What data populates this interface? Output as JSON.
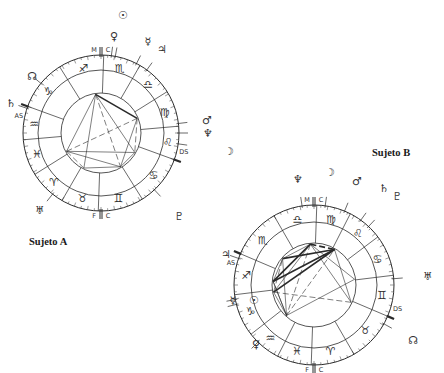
{
  "labels": {
    "subject_a": "Sujeto A",
    "subject_b": "Sujeto B"
  },
  "colors": {
    "ink": "#2a2a2a",
    "thin_line": "#555555",
    "background": "#ffffff"
  },
  "angle_labels": {
    "mc": [
      "M",
      "C"
    ],
    "ic": [
      "F",
      "C"
    ],
    "asc": "AS",
    "dsc": "DS"
  },
  "charts": [
    {
      "id": "sujeto-a",
      "center": [
        101,
        133
      ],
      "radii": {
        "outer": 78,
        "mid": 63,
        "inner": 40
      },
      "asc_angle_deg": 160,
      "house_cusps_deg": [
        160,
        185,
        212,
        240,
        268,
        302,
        340,
        5,
        32,
        60,
        88,
        122
      ],
      "signs": [
        {
          "glyph": "♒",
          "name": "aquarius"
        },
        {
          "glyph": "♓",
          "name": "pisces"
        },
        {
          "glyph": "♈",
          "name": "aries"
        },
        {
          "glyph": "♉",
          "name": "taurus"
        },
        {
          "glyph": "♊",
          "name": "gemini"
        },
        {
          "glyph": "♋",
          "name": "cancer"
        },
        {
          "glyph": "♌",
          "name": "leo"
        },
        {
          "glyph": "♍",
          "name": "virgo"
        },
        {
          "glyph": "♎",
          "name": "libra"
        },
        {
          "glyph": "♏",
          "name": "scorpio"
        },
        {
          "glyph": "♐",
          "name": "sagittarius"
        },
        {
          "glyph": "♑",
          "name": "capricorn"
        }
      ],
      "planets": [
        {
          "glyph": "☉",
          "name": "sun",
          "pos": [
            123,
            15
          ]
        },
        {
          "glyph": "♀",
          "name": "venus",
          "pos": [
            114,
            36
          ]
        },
        {
          "glyph": "☿",
          "name": "mercury",
          "pos": [
            148,
            41
          ]
        },
        {
          "glyph": "♃",
          "name": "jupiter",
          "pos": [
            162,
            49
          ]
        },
        {
          "glyph": "☊",
          "name": "north-node",
          "pos": [
            32,
            76
          ]
        },
        {
          "glyph": "♄",
          "name": "saturn",
          "pos": [
            11,
            103
          ]
        },
        {
          "glyph": "♂",
          "name": "mars",
          "pos": [
            207,
            120
          ]
        },
        {
          "glyph": "♆",
          "name": "neptune",
          "pos": [
            208,
            133
          ]
        },
        {
          "glyph": "☽",
          "name": "moon",
          "pos": [
            229,
            151
          ]
        },
        {
          "glyph": "♅",
          "name": "uranus",
          "pos": [
            40,
            210
          ]
        },
        {
          "glyph": "♇",
          "name": "pluto",
          "pos": [
            179,
            216
          ]
        }
      ],
      "aspect_points_deg": [
        98,
        208,
        22,
        300,
        330,
        244
      ],
      "aspects": [
        [
          0,
          1,
          1
        ],
        [
          0,
          2,
          2
        ],
        [
          0,
          3,
          1
        ],
        [
          0,
          4,
          1
        ],
        [
          1,
          3,
          1
        ],
        [
          1,
          2,
          1
        ],
        [
          2,
          3,
          1
        ],
        [
          2,
          4,
          1
        ],
        [
          3,
          4,
          1
        ],
        [
          0,
          5,
          1
        ],
        [
          5,
          3,
          1
        ],
        [
          5,
          1,
          1
        ],
        [
          4,
          1,
          1
        ]
      ]
    },
    {
      "id": "sujeto-b",
      "center": [
        314,
        285
      ],
      "radii": {
        "outer": 80,
        "mid": 63,
        "inner": 42
      },
      "asc_angle_deg": 157,
      "house_cusps_deg": [
        157,
        187,
        218,
        243,
        268,
        300,
        337,
        7,
        37,
        63,
        88,
        120
      ],
      "signs": [
        {
          "glyph": "♐",
          "name": "sagittarius"
        },
        {
          "glyph": "♑",
          "name": "capricorn"
        },
        {
          "glyph": "♒",
          "name": "aquarius"
        },
        {
          "glyph": "♓",
          "name": "pisces"
        },
        {
          "glyph": "♈",
          "name": "aries"
        },
        {
          "glyph": "♉",
          "name": "taurus"
        },
        {
          "glyph": "♊",
          "name": "gemini"
        },
        {
          "glyph": "♋",
          "name": "cancer"
        },
        {
          "glyph": "♌",
          "name": "leo"
        },
        {
          "glyph": "♍",
          "name": "virgo"
        },
        {
          "glyph": "♎",
          "name": "libra"
        },
        {
          "glyph": "♏",
          "name": "scorpio"
        }
      ],
      "planets": [
        {
          "glyph": "☽",
          "name": "moon",
          "pos": [
            330,
            172
          ]
        },
        {
          "glyph": "♆",
          "name": "neptune",
          "pos": [
            298,
            179
          ]
        },
        {
          "glyph": "♂",
          "name": "mars",
          "pos": [
            357,
            181
          ]
        },
        {
          "glyph": "♄",
          "name": "saturn",
          "pos": [
            384,
            188
          ]
        },
        {
          "glyph": "♇",
          "name": "pluto",
          "pos": [
            397,
            196
          ]
        },
        {
          "glyph": "♃",
          "name": "jupiter",
          "pos": [
            226,
            254
          ]
        },
        {
          "glyph": "♅",
          "name": "uranus",
          "pos": [
            428,
            276
          ]
        },
        {
          "glyph": "☿",
          "name": "mercury",
          "pos": [
            233,
            300
          ]
        },
        {
          "glyph": "☉",
          "name": "sun",
          "pos": [
            254,
            300
          ]
        },
        {
          "glyph": "☊",
          "name": "north-node",
          "pos": [
            413,
            340
          ]
        },
        {
          "glyph": "♀",
          "name": "venus",
          "pos": [
            256,
            344
          ]
        }
      ],
      "aspect_points_deg": [
        95,
        175,
        190,
        228,
        335,
        8,
        60,
        140
      ],
      "aspects": [
        [
          0,
          1,
          2
        ],
        [
          0,
          2,
          1
        ],
        [
          0,
          3,
          1
        ],
        [
          0,
          4,
          1
        ],
        [
          0,
          6,
          2
        ],
        [
          1,
          6,
          2
        ],
        [
          2,
          6,
          2
        ],
        [
          1,
          7,
          1
        ],
        [
          2,
          7,
          1
        ],
        [
          7,
          6,
          2
        ],
        [
          3,
          6,
          1
        ],
        [
          3,
          5,
          1
        ],
        [
          3,
          1,
          1
        ],
        [
          3,
          2,
          1
        ],
        [
          4,
          6,
          1
        ],
        [
          4,
          2,
          1
        ],
        [
          0,
          5,
          1
        ],
        [
          7,
          3,
          1
        ],
        [
          1,
          3,
          1
        ],
        [
          0,
          7,
          1
        ]
      ]
    }
  ]
}
